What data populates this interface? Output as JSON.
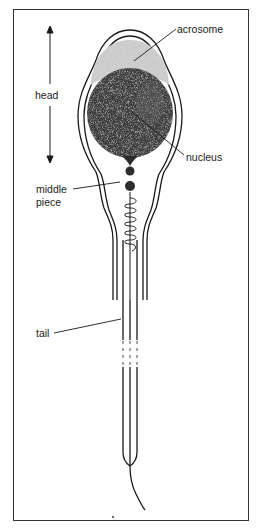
{
  "figure": {
    "labels": {
      "head": "head",
      "acrosome": "acrosome",
      "nucleus": "nucleus",
      "middle_piece_line1": "middle",
      "middle_piece_line2": "piece",
      "tail": "tail"
    },
    "colors": {
      "outline": "#1a1a1a",
      "acrosome_fill": "#c9c9c9",
      "nucleus_fill": "#3a3a3a",
      "frame": "#333333",
      "background": "#ffffff"
    }
  }
}
